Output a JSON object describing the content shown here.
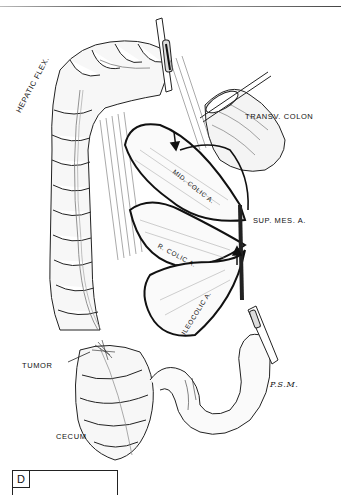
{
  "figure": {
    "panel_letter": "D",
    "signature": "P.S.M.",
    "labels": {
      "hepatic_flexure": "HEPATIC FLEX.",
      "transverse_colon": "TRANSV. COLON",
      "middle_colic_artery": "MID. COLIC A.",
      "superior_mesenteric_artery": "SUP. MES. A.",
      "right_colic_artery": "R. COLIC A.",
      "ileocolic_artery": "ILEOCOLIC A.",
      "tumor": "TUMOR",
      "cecum": "CECUM"
    },
    "annotations": [
      {
        "type": "arrow",
        "points_to": "mesentery notch near middle colic artery"
      },
      {
        "type": "arrow",
        "points_to": "superior mesenteric artery origin"
      }
    ],
    "clamps": [
      "hepatic-flexure-clamp",
      "transverse-colon-clamp",
      "ileum-clamp"
    ]
  }
}
